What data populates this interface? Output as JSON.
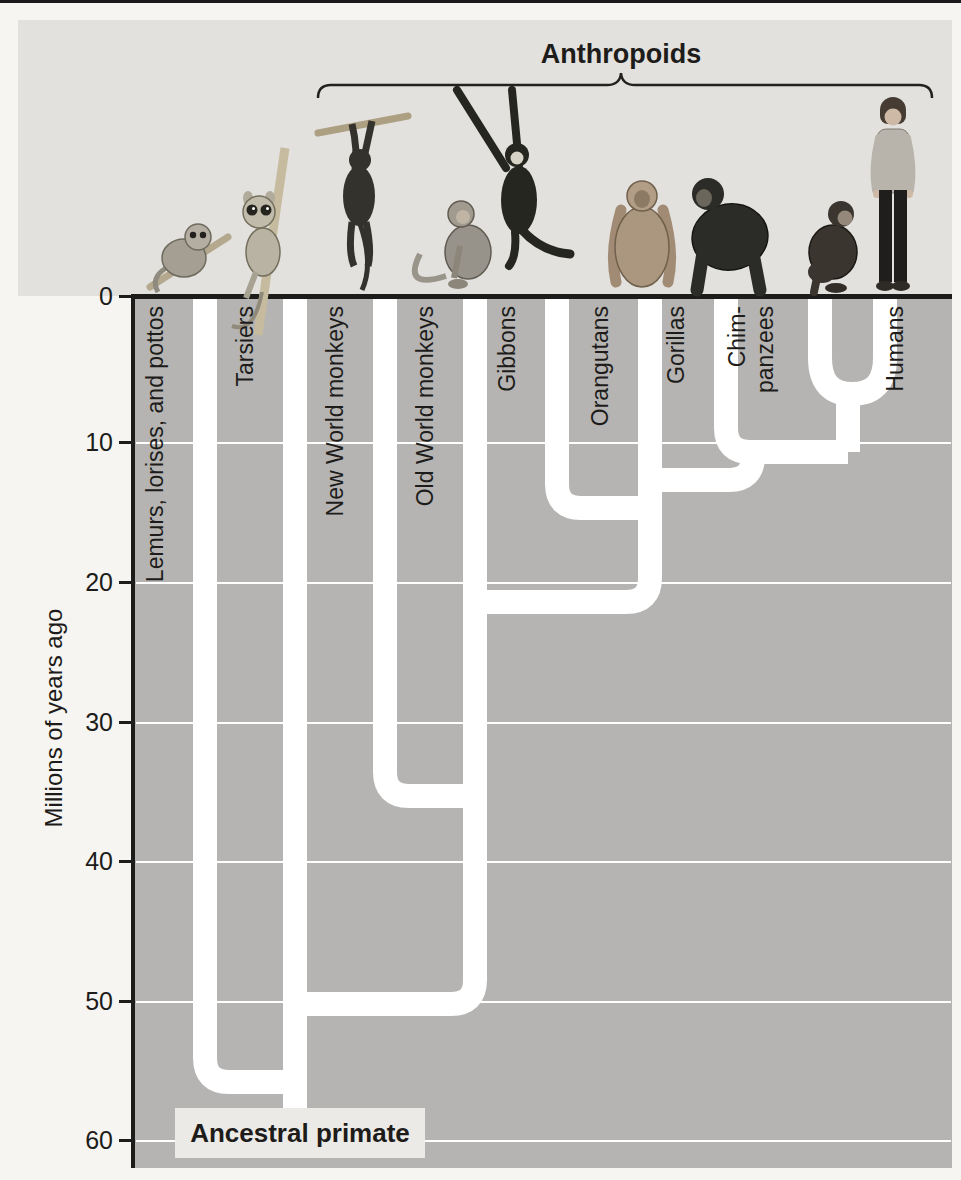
{
  "header": {
    "bracket_label": "Anthropoids"
  },
  "axis": {
    "title": "Millions of years ago",
    "ticks": [
      "0",
      "10",
      "20",
      "30",
      "40",
      "50",
      "60"
    ],
    "range_mya": [
      0,
      60
    ]
  },
  "tree": {
    "root_label": "Ancestral primate",
    "root_age_mya_approx": 58,
    "branch_color": "#ffffff",
    "taxa": [
      {
        "label": "Lemurs, lorises, and pottos",
        "divergence_mya": 56,
        "anthropoid": false,
        "illustration": "loris-on-branch"
      },
      {
        "label": "Tarsiers",
        "divergence_mya": 50,
        "anthropoid": false,
        "illustration": "tarsier-on-branch"
      },
      {
        "label": "New World monkeys",
        "divergence_mya": 35,
        "anthropoid": true,
        "illustration": "spider-monkey-hanging"
      },
      {
        "label": "Old World monkeys",
        "divergence_mya": 22,
        "anthropoid": true,
        "illustration": "macaque-sitting"
      },
      {
        "label": "Gibbons",
        "divergence_mya": 15,
        "anthropoid": true,
        "illustration": "gibbon-brachiating"
      },
      {
        "label": "Orangutans",
        "divergence_mya": 13,
        "anthropoid": true,
        "illustration": "orangutan-standing"
      },
      {
        "label": "Gorillas",
        "divergence_mya": 10,
        "anthropoid": true,
        "illustration": "gorilla-knuckle-walking"
      },
      {
        "label": "Chimpanzees",
        "label_line1": "Chim-",
        "label_line2": "panzees",
        "divergence_mya": 7,
        "anthropoid": true,
        "illustration": "chimpanzee-crouching"
      },
      {
        "label": "Humans",
        "divergence_mya": 7,
        "anthropoid": true,
        "illustration": "human-woman-standing"
      }
    ]
  },
  "colors": {
    "top_panel": "#e3e1dd",
    "plot_panel": "#b5b4b2",
    "branch": "#ffffff",
    "ink": "#1c1c1b",
    "root_box": "#eceae6"
  }
}
